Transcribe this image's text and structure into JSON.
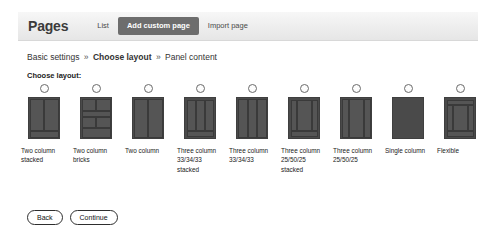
{
  "header": {
    "title": "Pages",
    "tabs": [
      {
        "label": "List",
        "active": false
      },
      {
        "label": "Add custom page",
        "active": true
      },
      {
        "label": "Import page",
        "active": false
      }
    ]
  },
  "breadcrumb": {
    "items": [
      {
        "label": "Basic settings",
        "current": false
      },
      {
        "label": "Choose layout",
        "current": true
      },
      {
        "label": "Panel content",
        "current": false
      }
    ],
    "separator": "»"
  },
  "section": {
    "choose_layout_label": "Choose layout:"
  },
  "layouts": [
    {
      "id": "two-column-stacked",
      "label": "Two column stacked",
      "selected": false,
      "segments": [
        {
          "left": 1,
          "top": 1,
          "width": 14,
          "height": 32
        },
        {
          "left": 15,
          "top": 1,
          "width": 15,
          "height": 32
        },
        {
          "left": 1,
          "top": 33,
          "width": 29,
          "height": 7
        }
      ]
    },
    {
      "id": "two-column-bricks",
      "label": "Two column bricks",
      "selected": false,
      "segments": [
        {
          "left": 1,
          "top": 1,
          "width": 14,
          "height": 12
        },
        {
          "left": 15,
          "top": 1,
          "width": 15,
          "height": 12
        },
        {
          "left": 1,
          "top": 13,
          "width": 29,
          "height": 6
        },
        {
          "left": 1,
          "top": 19,
          "width": 14,
          "height": 11
        },
        {
          "left": 15,
          "top": 19,
          "width": 15,
          "height": 11
        },
        {
          "left": 1,
          "top": 30,
          "width": 29,
          "height": 10
        }
      ]
    },
    {
      "id": "two-column",
      "label": "Two column",
      "selected": false,
      "segments": [
        {
          "left": 1,
          "top": 1,
          "width": 14,
          "height": 39
        },
        {
          "left": 15,
          "top": 1,
          "width": 15,
          "height": 39
        }
      ]
    },
    {
      "id": "three-column-33-34-33-stacked",
      "label": "Three column 33/34/33 stacked",
      "selected": false,
      "segments": [
        {
          "left": 2,
          "top": 2,
          "width": 9,
          "height": 31
        },
        {
          "left": 11,
          "top": 2,
          "width": 9,
          "height": 31
        },
        {
          "left": 20,
          "top": 2,
          "width": 9,
          "height": 31
        },
        {
          "left": 2,
          "top": 33,
          "width": 27,
          "height": 6
        }
      ]
    },
    {
      "id": "three-column-33-34-33",
      "label": "Three column 33/34/33",
      "selected": false,
      "segments": [
        {
          "left": 1,
          "top": 1,
          "width": 10,
          "height": 39
        },
        {
          "left": 11,
          "top": 1,
          "width": 9,
          "height": 39
        },
        {
          "left": 20,
          "top": 1,
          "width": 10,
          "height": 39
        }
      ]
    },
    {
      "id": "three-column-25-50-25-stacked",
      "label": "Three column 25/50/25 stacked",
      "selected": false,
      "segments": [
        {
          "left": 2,
          "top": 2,
          "width": 6,
          "height": 31
        },
        {
          "left": 8,
          "top": 2,
          "width": 15,
          "height": 31
        },
        {
          "left": 23,
          "top": 2,
          "width": 6,
          "height": 31
        },
        {
          "left": 2,
          "top": 33,
          "width": 27,
          "height": 6
        }
      ]
    },
    {
      "id": "three-column-25-50-25",
      "label": "Three column 25/50/25",
      "selected": false,
      "segments": [
        {
          "left": 1,
          "top": 1,
          "width": 7,
          "height": 39
        },
        {
          "left": 8,
          "top": 1,
          "width": 15,
          "height": 39
        },
        {
          "left": 23,
          "top": 1,
          "width": 7,
          "height": 39
        }
      ]
    },
    {
      "id": "single-column",
      "label": "Single column",
      "selected": false,
      "segments": []
    },
    {
      "id": "flexible",
      "label": "Flexible",
      "selected": false,
      "segments": [
        {
          "left": 2,
          "top": 2,
          "width": 27,
          "height": 5
        },
        {
          "left": 2,
          "top": 7,
          "width": 6,
          "height": 26
        },
        {
          "left": 8,
          "top": 7,
          "width": 15,
          "height": 26
        },
        {
          "left": 23,
          "top": 7,
          "width": 6,
          "height": 26
        },
        {
          "left": 2,
          "top": 33,
          "width": 27,
          "height": 6
        }
      ]
    }
  ],
  "footer": {
    "back_label": "Back",
    "continue_label": "Continue"
  }
}
